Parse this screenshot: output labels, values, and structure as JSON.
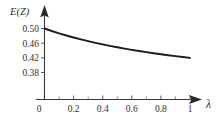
{
  "chart_data": {
    "type": "line",
    "title": "",
    "xlabel": "λ",
    "ylabel": "E(Z)",
    "xlim": [
      0,
      1.05
    ],
    "ylim": [
      0.355,
      0.515
    ],
    "grid": false,
    "legend": null,
    "x_ticks": [
      0,
      0.2,
      0.4,
      0.6,
      0.8,
      1
    ],
    "x_tick_labels": [
      "0",
      "0.2",
      "0.4",
      "0.6",
      "0.8",
      "1"
    ],
    "x_minor_ticks": [
      0.1,
      0.3,
      0.5,
      0.7,
      0.9
    ],
    "y_ticks": [
      0.38,
      0.42,
      0.46,
      0.5
    ],
    "y_tick_labels": [
      "0.38",
      "0.42",
      "0.46",
      "0.50"
    ],
    "series": [
      {
        "name": "E(Z)",
        "color": "#1c1c1c",
        "x": [
          0,
          0.05,
          0.1,
          0.15,
          0.2,
          0.25,
          0.3,
          0.35,
          0.4,
          0.45,
          0.5,
          0.55,
          0.6,
          0.65,
          0.7,
          0.75,
          0.8,
          0.85,
          0.9,
          0.95,
          1
        ],
        "values": [
          0.5,
          0.4932,
          0.4869,
          0.481,
          0.4755,
          0.4703,
          0.4655,
          0.4609,
          0.4566,
          0.4526,
          0.4488,
          0.4452,
          0.4418,
          0.4386,
          0.4355,
          0.4326,
          0.4298,
          0.4272,
          0.4247,
          0.4223,
          0.42
        ]
      }
    ],
    "annotations": []
  },
  "labels": {
    "y_axis_title": "E(Z)",
    "x_axis_title": "λ"
  }
}
